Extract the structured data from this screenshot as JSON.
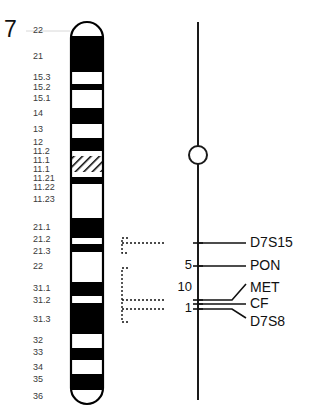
{
  "figure": {
    "chromosome_number": "7"
  },
  "chart_data": {
    "type": "diagram",
    "xlabel": "",
    "ylabel": "",
    "grid": false,
    "legend": "none",
    "ideogram": {
      "chromosome": "7",
      "band_labels": [
        {
          "label": "22",
          "y": 31
        },
        {
          "label": "21",
          "y": 57
        },
        {
          "label": "15.3",
          "y": 78
        },
        {
          "label": "15.2",
          "y": 88
        },
        {
          "label": "15.1",
          "y": 99
        },
        {
          "label": "14",
          "y": 114
        },
        {
          "label": "13",
          "y": 130
        },
        {
          "label": "12",
          "y": 143
        },
        {
          "label": "11.2",
          "y": 152
        },
        {
          "label": "11.1",
          "y": 161
        },
        {
          "label": "11.1",
          "y": 170
        },
        {
          "label": "11.21",
          "y": 179
        },
        {
          "label": "11.22",
          "y": 188
        },
        {
          "label": "11.23",
          "y": 200
        },
        {
          "label": "21.1",
          "y": 228
        },
        {
          "label": "21.2",
          "y": 240
        },
        {
          "label": "21.3",
          "y": 252
        },
        {
          "label": "22",
          "y": 267
        },
        {
          "label": "31.1",
          "y": 289
        },
        {
          "label": "31.2",
          "y": 301
        },
        {
          "label": "31.3",
          "y": 320
        },
        {
          "label": "32",
          "y": 341
        },
        {
          "label": "33",
          "y": 353
        },
        {
          "label": "34",
          "y": 368
        },
        {
          "label": "35",
          "y": 380
        },
        {
          "label": "36",
          "y": 397
        }
      ],
      "bands": [
        {
          "start": 22,
          "end": 36,
          "stain": "white"
        },
        {
          "start": 36,
          "end": 72,
          "stain": "black"
        },
        {
          "start": 72,
          "end": 84,
          "stain": "white"
        },
        {
          "start": 84,
          "end": 90,
          "stain": "black"
        },
        {
          "start": 90,
          "end": 108,
          "stain": "white"
        },
        {
          "start": 108,
          "end": 124,
          "stain": "black"
        },
        {
          "start": 124,
          "end": 138,
          "stain": "white"
        },
        {
          "start": 138,
          "end": 151,
          "stain": "black"
        },
        {
          "start": 151,
          "end": 156,
          "stain": "white"
        },
        {
          "start": 156,
          "end": 172,
          "stain": "hatched"
        },
        {
          "start": 172,
          "end": 177,
          "stain": "white"
        },
        {
          "start": 177,
          "end": 184,
          "stain": "black"
        },
        {
          "start": 184,
          "end": 218,
          "stain": "white"
        },
        {
          "start": 218,
          "end": 238,
          "stain": "black"
        },
        {
          "start": 238,
          "end": 244,
          "stain": "white"
        },
        {
          "start": 244,
          "end": 252,
          "stain": "black"
        },
        {
          "start": 252,
          "end": 282,
          "stain": "white"
        },
        {
          "start": 282,
          "end": 296,
          "stain": "black"
        },
        {
          "start": 296,
          "end": 303,
          "stain": "white"
        },
        {
          "start": 303,
          "end": 334,
          "stain": "black"
        },
        {
          "start": 334,
          "end": 348,
          "stain": "white"
        },
        {
          "start": 348,
          "end": 360,
          "stain": "black"
        },
        {
          "start": 360,
          "end": 374,
          "stain": "white"
        },
        {
          "start": 374,
          "end": 390,
          "stain": "black"
        },
        {
          "start": 390,
          "end": 404,
          "stain": "white"
        }
      ]
    },
    "linkage_map": {
      "axis_top": 22,
      "axis_bottom": 400,
      "centromere_marker_y": 155,
      "markers": [
        {
          "name": "D7S15",
          "y": 243
        },
        {
          "name": "PON",
          "y": 266
        },
        {
          "name": "MET",
          "y": 288
        },
        {
          "name": "CF",
          "y": 304
        },
        {
          "name": "D7S8",
          "y": 322
        }
      ],
      "distances": [
        {
          "value": "5",
          "between": [
            "D7S15",
            "PON"
          ],
          "y": 265
        },
        {
          "value": "10",
          "between": [
            "PON",
            "MET"
          ],
          "y": 287
        },
        {
          "value": "1",
          "between": [
            "MET",
            "CF"
          ],
          "y": 308
        }
      ],
      "brackets": [
        {
          "top": 238,
          "bottom": 253
        },
        {
          "top": 268,
          "bottom": 322
        }
      ]
    },
    "colors": {
      "band_dark": "#000000",
      "band_light": "#ffffff",
      "outline": "#000000",
      "label_text": "#3a3a3a",
      "marker_text": "#111111"
    }
  }
}
